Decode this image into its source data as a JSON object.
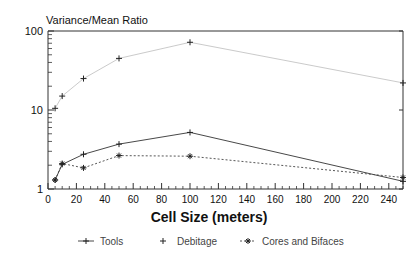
{
  "chart_data": {
    "type": "line",
    "title": "",
    "ylabel": "Variance/Mean Ratio",
    "xlabel": "Cell Size (meters)",
    "xlim": [
      0,
      250
    ],
    "ylim": [
      1,
      100
    ],
    "yscale": "log",
    "xscale": "linear",
    "grid": false,
    "legend_position": "bottom",
    "xticks": [
      0,
      20,
      40,
      60,
      80,
      100,
      120,
      140,
      160,
      180,
      200,
      220,
      240
    ],
    "xtick_labels": [
      "0",
      "20",
      "40",
      "60",
      "80",
      "100",
      "120",
      "140",
      "160",
      "180",
      "200",
      "220",
      "240"
    ],
    "yticks": [
      1,
      10,
      100
    ],
    "ytick_labels": [
      "1",
      "10",
      "100"
    ],
    "x": [
      5,
      10,
      25,
      50,
      100,
      250
    ],
    "series": [
      {
        "name": "Tools",
        "marker": "plus",
        "linestyle": "solid",
        "color": "#333333",
        "values": [
          1.3,
          2.05,
          2.75,
          3.7,
          5.2,
          1.25
        ]
      },
      {
        "name": "Debitage",
        "marker": "plus",
        "linestyle": "faint",
        "color": "#333333",
        "values": [
          10.5,
          15.0,
          25.0,
          45.0,
          72.0,
          22.0
        ]
      },
      {
        "name": "Cores and Bifaces",
        "marker": "asterisk",
        "linestyle": "dotted",
        "color": "#333333",
        "values": [
          1.3,
          2.1,
          1.85,
          2.65,
          2.6,
          1.4
        ]
      }
    ]
  },
  "legend": {
    "entries": [
      {
        "label": "Tools",
        "marker": "plus",
        "linestyle": "solid"
      },
      {
        "label": "Debitage",
        "marker": "plus",
        "linestyle": "none"
      },
      {
        "label": "Cores and Bifaces",
        "marker": "asterisk",
        "linestyle": "dotted"
      }
    ]
  },
  "axes": {
    "y_axis_title": "Variance/Mean Ratio",
    "x_axis_title": "Cell Size (meters)"
  }
}
